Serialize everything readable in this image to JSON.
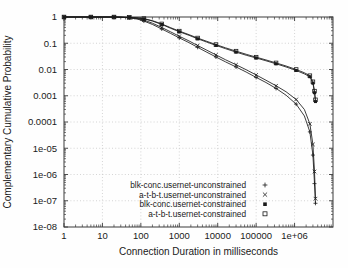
{
  "chart_data": {
    "type": "line",
    "title": "",
    "xlabel": "Connection Duration in milliseconds",
    "ylabel": "Complementary Cumulative Probability",
    "xscale": "log",
    "yscale": "log",
    "xlim": [
      1,
      10000000
    ],
    "ylim": [
      1e-08,
      1
    ],
    "grid": true,
    "legend_position": "bottom-center-inside",
    "xticks": [
      1,
      10,
      100,
      1000,
      10000,
      100000,
      1000000
    ],
    "xtick_labels": [
      "1",
      "10",
      "100",
      "1000",
      "10000",
      "100000",
      "1e+06"
    ],
    "yticks": [
      1,
      0.1,
      0.01,
      0.001,
      0.0001,
      1e-05,
      1e-06,
      1e-07,
      1e-08
    ],
    "ytick_labels": [
      "1",
      "0.1",
      "0.01",
      "0.001",
      "0.0001",
      "1e-05",
      "1e-06",
      "1e-07",
      "1e-08"
    ],
    "series": [
      {
        "name": "blk-conc.usernet-unconstrained",
        "marker": "plus",
        "marker_glyph": "+",
        "points": [
          [
            1,
            1.0
          ],
          [
            2,
            1.0
          ],
          [
            5,
            1.0
          ],
          [
            10,
            1.0
          ],
          [
            20,
            0.995
          ],
          [
            30,
            0.975
          ],
          [
            50,
            0.93
          ],
          [
            80,
            0.84
          ],
          [
            120,
            0.7
          ],
          [
            200,
            0.52
          ],
          [
            350,
            0.35
          ],
          [
            600,
            0.235
          ],
          [
            1000,
            0.16
          ],
          [
            1800,
            0.105
          ],
          [
            3000,
            0.07
          ],
          [
            5000,
            0.047
          ],
          [
            9000,
            0.03
          ],
          [
            16000,
            0.0195
          ],
          [
            30000,
            0.0125
          ],
          [
            55000,
            0.008
          ],
          [
            100000,
            0.005
          ],
          [
            180000,
            0.0032
          ],
          [
            330000,
            0.0019
          ],
          [
            600000,
            0.00105
          ],
          [
            1100000,
            0.00048
          ],
          [
            1800000,
            0.00017
          ],
          [
            2500000,
            4.2e-05
          ],
          [
            3000000,
            5.5e-06
          ],
          [
            3300000,
            4.5e-07
          ],
          [
            3500000,
            8e-08
          ]
        ]
      },
      {
        "name": "a-t-b-t.usernet-unconstrained",
        "marker": "cross",
        "marker_glyph": "x",
        "points": [
          [
            1,
            1.0
          ],
          [
            2,
            1.0
          ],
          [
            5,
            1.0
          ],
          [
            10,
            1.0
          ],
          [
            20,
            0.995
          ],
          [
            30,
            0.98
          ],
          [
            50,
            0.945
          ],
          [
            80,
            0.875
          ],
          [
            120,
            0.765
          ],
          [
            200,
            0.58
          ],
          [
            350,
            0.4
          ],
          [
            600,
            0.27
          ],
          [
            1000,
            0.185
          ],
          [
            1800,
            0.122
          ],
          [
            3000,
            0.082
          ],
          [
            5000,
            0.056
          ],
          [
            9000,
            0.036
          ],
          [
            16000,
            0.0235
          ],
          [
            30000,
            0.0152
          ],
          [
            55000,
            0.0098
          ],
          [
            100000,
            0.0062
          ],
          [
            180000,
            0.0039
          ],
          [
            330000,
            0.0024
          ],
          [
            600000,
            0.00142
          ],
          [
            1100000,
            0.00072
          ],
          [
            1800000,
            0.0003
          ],
          [
            2500000,
            8.5e-05
          ],
          [
            3000000,
            1.4e-05
          ],
          [
            3300000,
            1.3e-06
          ],
          [
            3500000,
            1.2e-07
          ]
        ]
      },
      {
        "name": "blk-conc.usernet-constrained",
        "marker": "filled-square",
        "marker_glyph": "■",
        "points": [
          [
            1,
            1.0
          ],
          [
            2,
            1.0
          ],
          [
            5,
            1.0
          ],
          [
            10,
            1.0
          ],
          [
            20,
            0.998
          ],
          [
            30,
            0.99
          ],
          [
            50,
            0.965
          ],
          [
            80,
            0.92
          ],
          [
            120,
            0.85
          ],
          [
            200,
            0.7
          ],
          [
            350,
            0.52
          ],
          [
            600,
            0.37
          ],
          [
            1000,
            0.275
          ],
          [
            1800,
            0.2
          ],
          [
            3000,
            0.148
          ],
          [
            5000,
            0.113
          ],
          [
            9000,
            0.083
          ],
          [
            16000,
            0.062
          ],
          [
            30000,
            0.046
          ],
          [
            55000,
            0.035
          ],
          [
            100000,
            0.0275
          ],
          [
            180000,
            0.0215
          ],
          [
            330000,
            0.0165
          ],
          [
            600000,
            0.0125
          ],
          [
            1100000,
            0.0092
          ],
          [
            1800000,
            0.0068
          ],
          [
            2500000,
            0.0053
          ],
          [
            3000000,
            0.003
          ],
          [
            3300000,
            0.0013
          ],
          [
            3500000,
            0.0006
          ]
        ]
      },
      {
        "name": "a-t-b-t.usernet-constrained",
        "marker": "open-square",
        "marker_glyph": "□",
        "points": [
          [
            1,
            1.0
          ],
          [
            2,
            1.0
          ],
          [
            5,
            1.0
          ],
          [
            10,
            1.0
          ],
          [
            20,
            0.998
          ],
          [
            30,
            0.992
          ],
          [
            50,
            0.97
          ],
          [
            80,
            0.93
          ],
          [
            120,
            0.87
          ],
          [
            200,
            0.725
          ],
          [
            350,
            0.545
          ],
          [
            600,
            0.39
          ],
          [
            1000,
            0.29
          ],
          [
            1800,
            0.212
          ],
          [
            3000,
            0.158
          ],
          [
            5000,
            0.121
          ],
          [
            9000,
            0.089
          ],
          [
            16000,
            0.067
          ],
          [
            30000,
            0.05
          ],
          [
            55000,
            0.038
          ],
          [
            100000,
            0.0295
          ],
          [
            180000,
            0.0232
          ],
          [
            330000,
            0.0178
          ],
          [
            600000,
            0.0136
          ],
          [
            1100000,
            0.01
          ],
          [
            1800000,
            0.0075
          ],
          [
            2500000,
            0.0058
          ],
          [
            3000000,
            0.0034
          ],
          [
            3300000,
            0.0015
          ],
          [
            3500000,
            0.0007
          ]
        ]
      }
    ]
  }
}
